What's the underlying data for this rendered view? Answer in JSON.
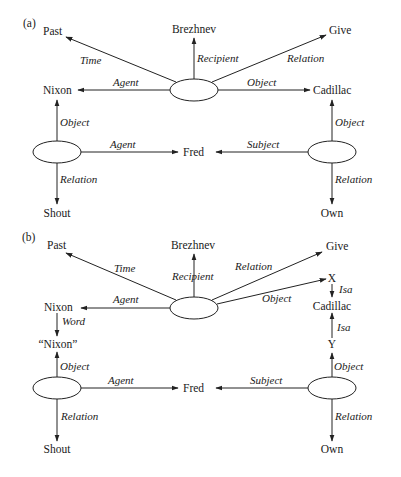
{
  "colors": {
    "line": "#222222",
    "text": "#1a1a1a",
    "background": "#ffffff"
  },
  "panel_a": {
    "label": "(a)",
    "nodes": {
      "past": "Past",
      "brezhnev": "Brezhnev",
      "give": "Give",
      "nixon": "Nixon",
      "cadillac": "Cadillac",
      "fred": "Fred",
      "shout": "Shout",
      "own": "Own"
    },
    "edges": {
      "time": "Time",
      "recipient": "Recipient",
      "relation_give": "Relation",
      "agent_nixon": "Agent",
      "object_cadillac": "Object",
      "object_nixon": "Object",
      "object_own": "Object",
      "agent_fred": "Agent",
      "subject_fred": "Subject",
      "relation_shout": "Relation",
      "relation_own": "Relation"
    }
  },
  "panel_b": {
    "label": "(b)",
    "nodes": {
      "past": "Past",
      "brezhnev": "Brezhnev",
      "give": "Give",
      "nixon": "Nixon",
      "x": "X",
      "cadillac": "Cadillac",
      "y": "Y",
      "nixon_word": "“Nixon”",
      "fred": "Fred",
      "shout": "Shout",
      "own": "Own"
    },
    "edges": {
      "time": "Time",
      "recipient": "Recipient",
      "relation_give": "Relation",
      "object_x": "Object",
      "agent_nixon": "Agent",
      "word": "Word",
      "isa_x": "Isa",
      "isa_y": "Isa",
      "object_nixon_word": "Object",
      "object_y": "Object",
      "agent_fred": "Agent",
      "subject_fred": "Subject",
      "relation_shout": "Relation",
      "relation_own": "Relation"
    }
  }
}
